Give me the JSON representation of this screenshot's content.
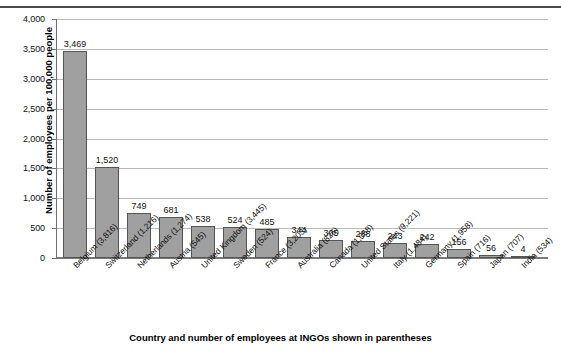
{
  "chart_data": {
    "type": "bar",
    "title": "",
    "xlabel": "Country and number of employees at INGOs shown in parentheses",
    "ylabel": "Number of employees per 100,000 people",
    "ylim": [
      0,
      4000
    ],
    "ytick_labels": [
      "0",
      "500",
      "1,000",
      "1,500",
      "2,000",
      "2,500",
      "3,000",
      "3,500",
      "4,000"
    ],
    "ytick_values": [
      0,
      500,
      1000,
      1500,
      2000,
      2500,
      3000,
      3500,
      4000
    ],
    "grid": true,
    "legend": "none",
    "categories": [
      "Belgium (3,816)",
      "Switzerland (1,216)",
      "Netherlands (1,274)",
      "Austria (545)",
      "United Kingdom (3,445)",
      "Sweden (524)",
      "France (3,203)",
      "Australia (826)",
      "Canada (1,068)",
      "United States (9,221)",
      "Italy (1,484)",
      "Germany (1,958)",
      "Spain (716)",
      "Japan (707)",
      "India (534)"
    ],
    "values": [
      3469,
      1520,
      749,
      681,
      538,
      524,
      485,
      344,
      305,
      288,
      243,
      242,
      156,
      56,
      4
    ],
    "value_labels": [
      "3,469",
      "1,520",
      "749",
      "681",
      "538",
      "524",
      "485",
      "344",
      "305",
      "288",
      "243",
      "242",
      "156",
      "56",
      "4"
    ],
    "bar_color": "#a0a0a0",
    "bar_border_color": "#555555",
    "grid_color": "#b9b9b9",
    "axis_color": "#6f6f6f"
  }
}
